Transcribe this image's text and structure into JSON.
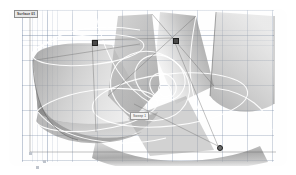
{
  "app": {
    "title_badge": "Surface 01",
    "background_color": "#ffffff",
    "grid_color": "#7a8caa",
    "surface_color": "#9a9a9a",
    "curve_color": "#ffffff",
    "marker_color": "#4a4a4a"
  },
  "viewport": {
    "name": "3d-viewport",
    "grid": {
      "visible": true,
      "fine_spacing_px": 5,
      "coarse_spacing_px": 25
    }
  },
  "labels": {
    "object_chip": "Sweep 1"
  },
  "markers": [
    {
      "id": "cp1",
      "shape": "square",
      "x": 92,
      "y": 40
    },
    {
      "id": "cp2",
      "shape": "square",
      "x": 173,
      "y": 38
    },
    {
      "id": "cp3",
      "shape": "round",
      "x": 218,
      "y": 146
    }
  ],
  "axis_points": [
    {
      "id": "ax1",
      "x": 29,
      "y": 152
    },
    {
      "id": "ax2",
      "x": 43,
      "y": 160
    },
    {
      "id": "ax3",
      "x": 36,
      "y": 166
    }
  ]
}
